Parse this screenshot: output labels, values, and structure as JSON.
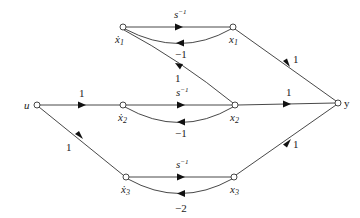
{
  "diagram": {
    "type": "signal-flow-graph",
    "nodes": [
      {
        "id": "u",
        "label": "u",
        "x": 37,
        "y": 105
      },
      {
        "id": "x1dot",
        "label": "ẋ",
        "sub": "1",
        "x": 123,
        "y": 27
      },
      {
        "id": "x1",
        "label": "x",
        "sub": "1",
        "x": 233,
        "y": 27
      },
      {
        "id": "x2dot",
        "label": "ẋ",
        "sub": "2",
        "x": 123,
        "y": 105
      },
      {
        "id": "x2",
        "label": "x",
        "sub": "2",
        "x": 235,
        "y": 105
      },
      {
        "id": "x3dot",
        "label": "ẋ",
        "sub": "3",
        "x": 126,
        "y": 177
      },
      {
        "id": "x3",
        "label": "x",
        "sub": "3",
        "x": 234,
        "y": 177
      },
      {
        "id": "y",
        "label": "y",
        "x": 338,
        "y": 103
      }
    ],
    "edges": [
      {
        "from": "u",
        "to": "x2dot",
        "gain": "1"
      },
      {
        "from": "u",
        "to": "x3dot",
        "gain": "1"
      },
      {
        "from": "x1dot",
        "to": "x1",
        "gain": "s",
        "gain_sup": "−1"
      },
      {
        "from": "x1",
        "to": "x1dot",
        "gain": "−1"
      },
      {
        "from": "x2",
        "to": "x1dot",
        "gain": "1"
      },
      {
        "from": "x2dot",
        "to": "x2",
        "gain": "s",
        "gain_sup": "−1"
      },
      {
        "from": "x2",
        "to": "x2dot",
        "gain": "−1"
      },
      {
        "from": "x3dot",
        "to": "x3",
        "gain": "s",
        "gain_sup": "−1"
      },
      {
        "from": "x3",
        "to": "x3dot",
        "gain": "−2"
      },
      {
        "from": "x1",
        "to": "y",
        "gain": "1"
      },
      {
        "from": "x2",
        "to": "y",
        "gain": "1"
      },
      {
        "from": "x3",
        "to": "y",
        "gain": "1"
      }
    ]
  },
  "labels": {
    "u": "u",
    "y": "y",
    "x": "x",
    "xdot": "ẋ",
    "s": "s",
    "inv": "−1",
    "one": "1",
    "neg_one": "−1",
    "neg_two": "−2",
    "sub1": "1",
    "sub2": "2",
    "sub3": "3"
  }
}
